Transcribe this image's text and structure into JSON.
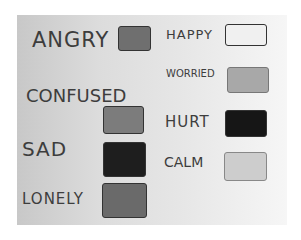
{
  "image": {
    "description": "Photo of hand-drawn paper mapping emotions to gray color swatches"
  },
  "left_column": [
    {
      "label": "ANGRY",
      "swatch_color": "#6f6f6f"
    },
    {
      "label": "CONFUSED",
      "swatch_color": "#7c7c7c"
    },
    {
      "label": "SAD",
      "swatch_color": "#1e1e1e"
    },
    {
      "label": "LONELY",
      "swatch_color": "#6a6a6a"
    }
  ],
  "right_column": [
    {
      "label": "HAPPY",
      "swatch_color": "#f0f0f0"
    },
    {
      "label": "WORRIED",
      "swatch_color": "#a8a8a8"
    },
    {
      "label": "HURT",
      "swatch_color": "#161616"
    },
    {
      "label": "CALM",
      "swatch_color": "#cdcdcd"
    }
  ]
}
